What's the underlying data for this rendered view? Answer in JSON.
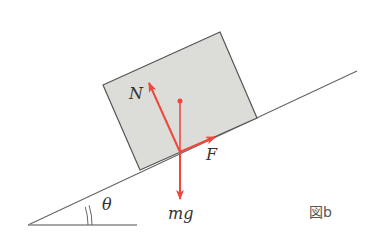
{
  "diagram": {
    "caption": "図b",
    "labels": {
      "normal_force": "N",
      "friction_force": "F",
      "weight": "mg",
      "angle": "θ"
    },
    "colors": {
      "force_arrows": "#f0463c",
      "block_fill": "#dcdcd8",
      "lines": "#555555"
    }
  }
}
